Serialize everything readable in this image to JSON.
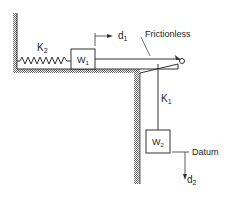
{
  "diagram": {
    "type": "mechanical-system",
    "labels": {
      "spring_left": "K",
      "spring_left_sub": "2",
      "mass_top": "W",
      "mass_top_sub": "1",
      "displacement_top": "d",
      "displacement_top_sub": "1",
      "pulley_note": "Frictionless",
      "spring_vertical": "K",
      "spring_vertical_sub": "1",
      "mass_hanging": "W",
      "mass_hanging_sub": "2",
      "reference": "Datum",
      "displacement_hanging": "d",
      "displacement_hanging_sub": "2"
    },
    "colors": {
      "line": "#333333",
      "hatch": "#777777",
      "background": "#ffffff"
    }
  }
}
